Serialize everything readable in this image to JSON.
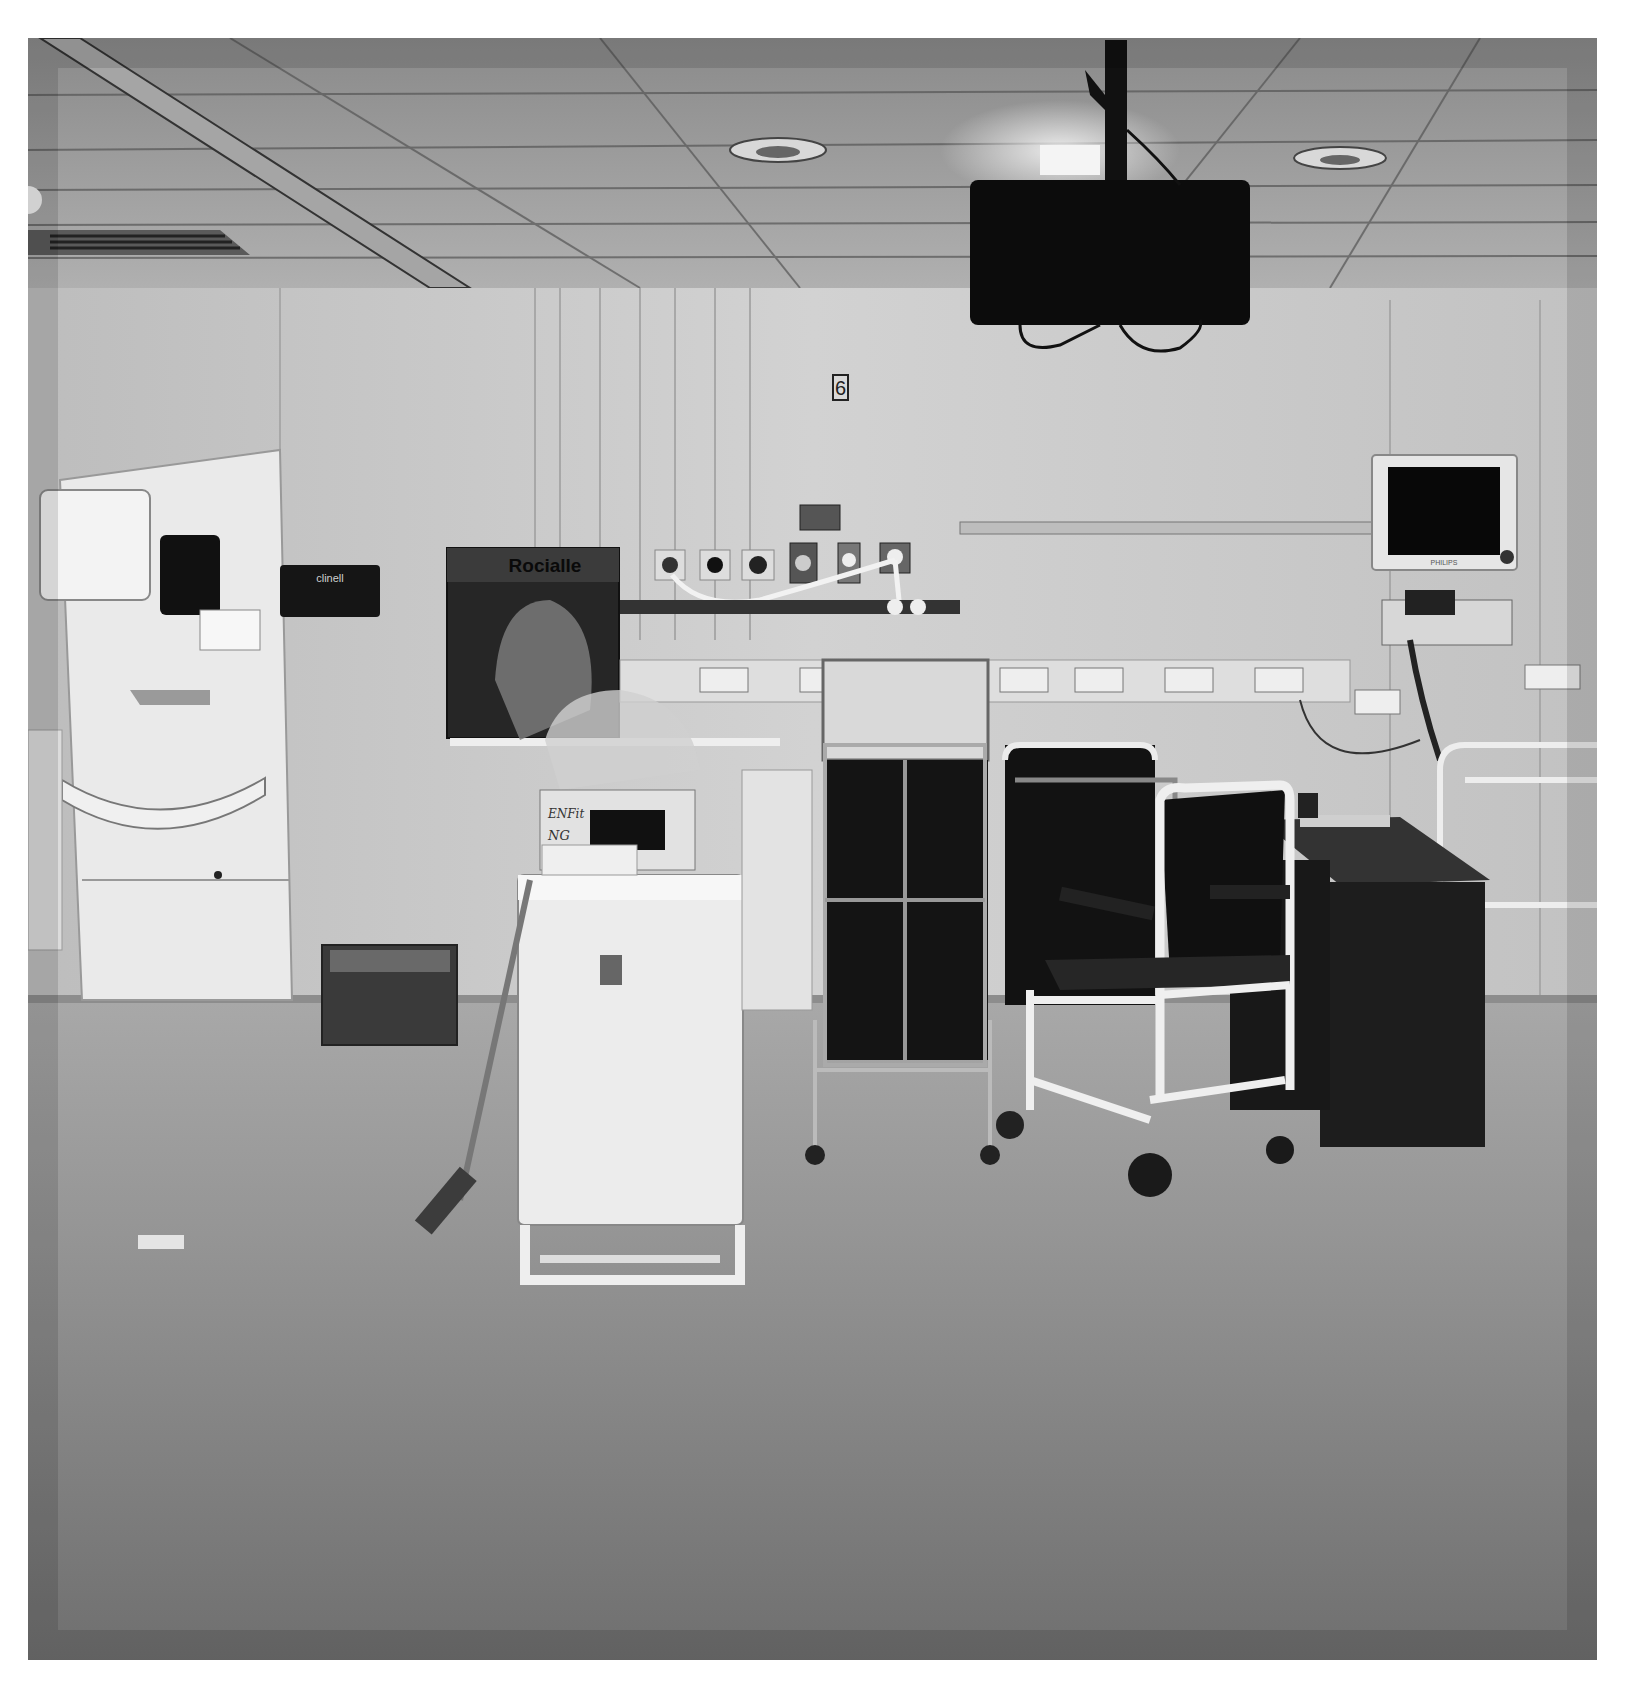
{
  "photo": {
    "description": "Black and white photograph of an empty hospital ward bay",
    "style": "monochrome",
    "frame": {
      "left": 28,
      "top": 38,
      "right": 1597,
      "bottom": 1660,
      "border_color": "#ffffff"
    },
    "palette": {
      "ceiling": "#9c9c9c",
      "wall": "#c9c9c9",
      "floor_near": "#7e7e7e",
      "floor_far": "#a3a3a3",
      "dark_objects": "#141414",
      "white_objects": "#ececec"
    }
  },
  "scene": {
    "bay_number": "6",
    "wipes_dispenser_label": "clinell",
    "supply_box_brand": "Rocialle",
    "handwritten_box_label": {
      "line1": "ENFit",
      "line2": "NG",
      "line3": "Giving sets"
    },
    "patient_monitor_brand": "PHILIPS"
  },
  "objects": [
    {
      "name": "ceiling-tv",
      "label": "Ceiling-mounted TV on pole"
    },
    {
      "name": "ceiling-light-left",
      "label": "Recessed ceiling light"
    },
    {
      "name": "ceiling-light-right",
      "label": "Recessed ceiling light"
    },
    {
      "name": "air-vent",
      "label": "Ceiling air vent"
    },
    {
      "name": "handwash-station",
      "label": "Wall-mounted sink unit with paper towel and soap dispensers"
    },
    {
      "name": "wipes-dispenser",
      "label": "Clinell wipes dispenser"
    },
    {
      "name": "medical-gas-outlets",
      "label": "Bed-head medical gas outlets"
    },
    {
      "name": "power-sockets-rail",
      "label": "Wall power sockets trunking"
    },
    {
      "name": "patient-monitor",
      "label": "Philips patient monitor"
    },
    {
      "name": "bedside-cabinet",
      "label": "White bedside locker"
    },
    {
      "name": "linen-trolley",
      "label": "Linen trolley"
    },
    {
      "name": "wheelchair",
      "label": "Wheelchair"
    },
    {
      "name": "commode-chair",
      "label": "Commode / shower chair"
    },
    {
      "name": "desk",
      "label": "Dark wooden desk"
    },
    {
      "name": "mop",
      "label": "Flat mop leaning on cabinet"
    },
    {
      "name": "storage-crate",
      "label": "Plastic storage crate"
    }
  ]
}
